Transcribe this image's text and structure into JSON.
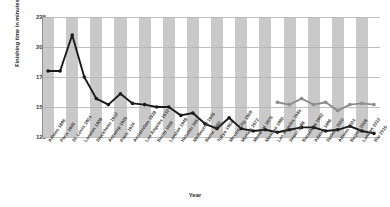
{
  "chart_data": {
    "type": "line",
    "title": "",
    "xlabel": "Year",
    "ylabel": "Finishing time in minutes",
    "ylim": [
      125,
      225
    ],
    "yticks": [
      225,
      200,
      175,
      150,
      125
    ],
    "grid": true,
    "legend": "none",
    "categories": [
      "Athens 1896",
      "Paris 1900",
      "St. Louis 1904",
      "London 1908",
      "Stockholm 1912",
      "Antwerp 1920",
      "Paris 1924",
      "Amsterdam 1928",
      "Los Angeles 1932",
      "Berlin 1936",
      "London 1948",
      "Helsinki 1952",
      "Melbourne 1956",
      "Rome 1960",
      "Tokyo 1964",
      "Mexico City 1968",
      "Munich 1972",
      "Montreal 1976",
      "Moscow 1980",
      "Los Angeles 1984",
      "Seoul 1988",
      "Barcelona 1992",
      "Atlanta 1996",
      "Sydney 2000",
      "Athens 2004",
      "Beijing 2008",
      "London 2012",
      "Rio 2016"
    ],
    "series": [
      {
        "name": "Men",
        "color": "#1a1a1a",
        "values": [
          180,
          180,
          210,
          175,
          157,
          152,
          161,
          153,
          152,
          150,
          150,
          143,
          145,
          136,
          132,
          141,
          132,
          130,
          131,
          129,
          131,
          133,
          133,
          130,
          131,
          134,
          130,
          128
        ]
      },
      {
        "name": "Women",
        "color": "#8c8c8c",
        "values": [
          null,
          null,
          null,
          null,
          null,
          null,
          null,
          null,
          null,
          null,
          null,
          null,
          null,
          null,
          null,
          null,
          null,
          null,
          null,
          154,
          152,
          157,
          152,
          154,
          147,
          152,
          153,
          152
        ]
      }
    ]
  }
}
